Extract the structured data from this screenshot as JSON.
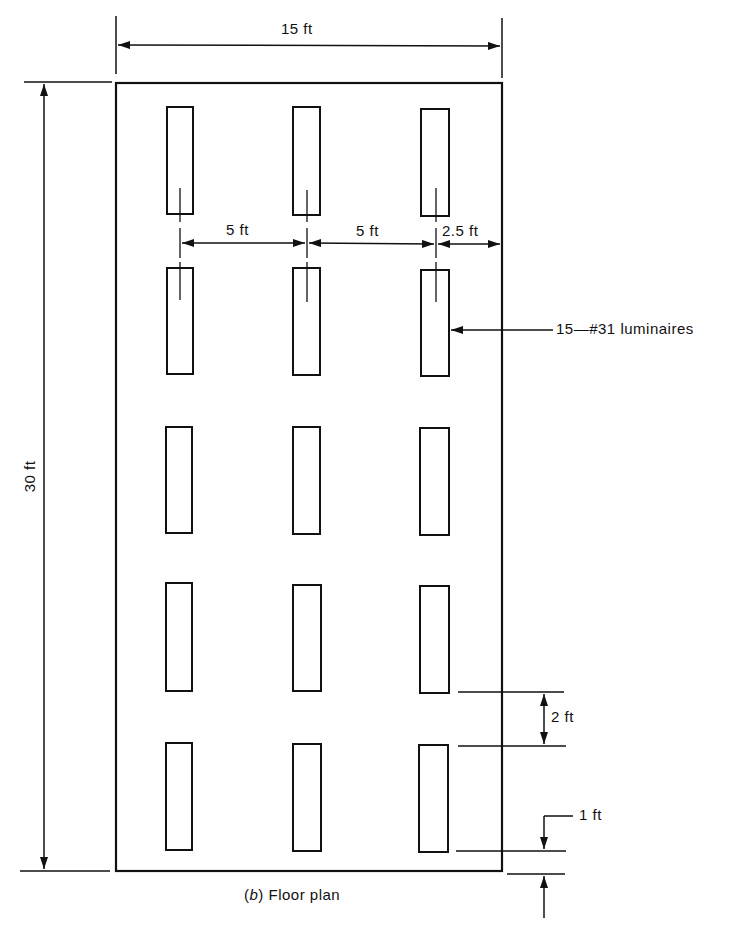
{
  "figure": {
    "caption_prefix": "(",
    "caption_letter": "b",
    "caption_text": ") Floor plan",
    "line_color": "#111111",
    "background": "#ffffff"
  },
  "dimensions": {
    "room_width": "15 ft",
    "room_length": "30 ft",
    "spacing_1": "5 ft",
    "spacing_2": "5 ft",
    "wall_offset": "2.5 ft",
    "row_gap": "2 ft",
    "end_offset": "1 ft"
  },
  "callout": {
    "luminaires": "15—#31 luminaires"
  },
  "layout": {
    "rows": 5,
    "columns": 3,
    "total_luminaires": 15
  }
}
